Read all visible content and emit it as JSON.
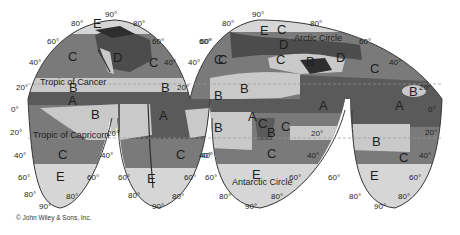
{
  "map": {
    "title": "World climate zones (interrupted projection)",
    "projection": "interrupted homolosine",
    "zone_legend": {
      "A": "Wet equatorial / tropical",
      "B": "Dry subtropical",
      "C": "Moist mid-latitude",
      "D": "Continental",
      "E": "Polar"
    },
    "colors": {
      "A": "#5a5a5a",
      "B": "#c9c9c9",
      "C": "#7a7a7a",
      "D": "#4c4c4c",
      "E": "#d6d6d6",
      "land_dark": "#2e2e2e",
      "tropic_line": "#9a9a9a",
      "outline": "#3a3a3a"
    },
    "reference_lines": {
      "tropic_of_cancer": "Tropic of Cancer",
      "tropic_of_capricorn": "Tropic of Capricorn",
      "arctic_circle": "Arctic Circle",
      "antarctic_circle": "Antarctic Circle"
    },
    "zone_labels": [
      {
        "id": "E",
        "x": 97,
        "y": 24
      },
      {
        "id": "C",
        "x": 72,
        "y": 57
      },
      {
        "id": "D",
        "x": 117,
        "y": 58
      },
      {
        "id": "C",
        "x": 153,
        "y": 63
      },
      {
        "id": "B",
        "x": 73,
        "y": 88
      },
      {
        "id": "B",
        "x": 165,
        "y": 88
      },
      {
        "id": "A",
        "x": 72,
        "y": 101
      },
      {
        "id": "B",
        "x": 95,
        "y": 115
      },
      {
        "id": "A",
        "x": 163,
        "y": 116
      },
      {
        "id": "B",
        "x": 218,
        "y": 96
      },
      {
        "id": "C",
        "x": 222,
        "y": 60
      },
      {
        "id": "C",
        "x": 62,
        "y": 155
      },
      {
        "id": "E",
        "x": 60,
        "y": 177
      },
      {
        "id": "C",
        "x": 180,
        "y": 155
      },
      {
        "id": "E",
        "x": 151,
        "y": 179
      },
      {
        "id": "E",
        "x": 264,
        "y": 31
      },
      {
        "id": "C",
        "x": 281,
        "y": 30
      },
      {
        "id": "D",
        "x": 283,
        "y": 45
      },
      {
        "id": "C",
        "x": 218,
        "y": 60
      },
      {
        "id": "C",
        "x": 280,
        "y": 60
      },
      {
        "id": "B",
        "x": 310,
        "y": 62
      },
      {
        "id": "D",
        "x": 340,
        "y": 58
      },
      {
        "id": "C",
        "x": 374,
        "y": 69
      },
      {
        "id": "B",
        "x": 244,
        "y": 89
      },
      {
        "id": "A",
        "x": 323,
        "y": 106
      },
      {
        "id": "A",
        "x": 399,
        "y": 106
      },
      {
        "id": "B",
        "x": 413,
        "y": 92
      },
      {
        "id": "A",
        "x": 252,
        "y": 117
      },
      {
        "id": "C",
        "x": 262,
        "y": 124
      },
      {
        "id": "B",
        "x": 271,
        "y": 133
      },
      {
        "id": "C",
        "x": 285,
        "y": 127
      },
      {
        "id": "B",
        "x": 218,
        "y": 128
      },
      {
        "id": "B",
        "x": 376,
        "y": 142
      },
      {
        "id": "C",
        "x": 271,
        "y": 154
      },
      {
        "id": "C",
        "x": 403,
        "y": 158
      },
      {
        "id": "E",
        "x": 256,
        "y": 175
      },
      {
        "id": "E",
        "x": 374,
        "y": 176
      }
    ],
    "degree_labels": [
      {
        "text": "90°",
        "x": 111,
        "y": 16
      },
      {
        "text": "80°",
        "x": 77,
        "y": 25
      },
      {
        "text": "80°",
        "x": 139,
        "y": 25
      },
      {
        "text": "60°",
        "x": 53,
        "y": 43
      },
      {
        "text": "60°",
        "x": 158,
        "y": 43
      },
      {
        "text": "40°",
        "x": 35,
        "y": 64
      },
      {
        "text": "40°",
        "x": 170,
        "y": 64
      },
      {
        "text": "20°",
        "x": 22,
        "y": 89
      },
      {
        "text": "20°",
        "x": 183,
        "y": 89
      },
      {
        "text": "0°",
        "x": 17,
        "y": 111
      },
      {
        "text": "20°",
        "x": 16,
        "y": 134
      },
      {
        "text": "20°",
        "x": 113,
        "y": 135
      },
      {
        "text": "40°",
        "x": 20,
        "y": 157
      },
      {
        "text": "40°",
        "x": 107,
        "y": 157
      },
      {
        "text": "60°",
        "x": 24,
        "y": 179
      },
      {
        "text": "60°",
        "x": 93,
        "y": 179
      },
      {
        "text": "80°",
        "x": 30,
        "y": 196
      },
      {
        "text": "80°",
        "x": 72,
        "y": 198
      },
      {
        "text": "90°",
        "x": 45,
        "y": 208
      },
      {
        "text": "60°",
        "x": 124,
        "y": 179
      },
      {
        "text": "60°",
        "x": 190,
        "y": 179
      },
      {
        "text": "40°",
        "x": 207,
        "y": 157
      },
      {
        "text": "80°",
        "x": 134,
        "y": 197
      },
      {
        "text": "80°",
        "x": 178,
        "y": 198
      },
      {
        "text": "90°",
        "x": 158,
        "y": 208
      },
      {
        "text": "60°",
        "x": 205,
        "y": 43
      },
      {
        "text": "40°",
        "x": 194,
        "y": 64
      },
      {
        "text": "90°",
        "x": 258,
        "y": 16
      },
      {
        "text": "80°",
        "x": 228,
        "y": 25
      },
      {
        "text": "80°",
        "x": 316,
        "y": 25
      },
      {
        "text": "60°",
        "x": 206,
        "y": 43
      },
      {
        "text": "60°",
        "x": 365,
        "y": 43
      },
      {
        "text": "40°",
        "x": 395,
        "y": 64
      },
      {
        "text": "20°",
        "x": 425,
        "y": 89
      },
      {
        "text": "0°",
        "x": 434,
        "y": 111
      },
      {
        "text": "20°",
        "x": 431,
        "y": 134
      },
      {
        "text": "20°",
        "x": 317,
        "y": 135
      },
      {
        "text": "40°",
        "x": 205,
        "y": 157
      },
      {
        "text": "40°",
        "x": 313,
        "y": 157
      },
      {
        "text": "40°",
        "x": 425,
        "y": 157
      },
      {
        "text": "60°",
        "x": 211,
        "y": 179
      },
      {
        "text": "60°",
        "x": 295,
        "y": 179
      },
      {
        "text": "60°",
        "x": 334,
        "y": 179
      },
      {
        "text": "60°",
        "x": 415,
        "y": 179
      },
      {
        "text": "80°",
        "x": 225,
        "y": 198
      },
      {
        "text": "80°",
        "x": 277,
        "y": 198
      },
      {
        "text": "80°",
        "x": 355,
        "y": 198
      },
      {
        "text": "80°",
        "x": 404,
        "y": 198
      },
      {
        "text": "90°",
        "x": 251,
        "y": 208
      },
      {
        "text": "90°",
        "x": 380,
        "y": 208
      }
    ],
    "copyright": "© John Wiley & Sons, Inc."
  }
}
